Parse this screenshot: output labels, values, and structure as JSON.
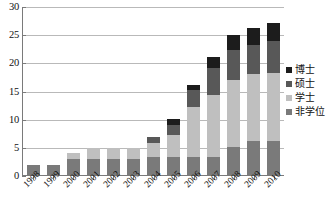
{
  "chart_data": {
    "type": "bar",
    "stacked": true,
    "title": "",
    "subtitle": "",
    "xlabel": "",
    "ylabel": "",
    "ylim": [
      0,
      30
    ],
    "yticks": [
      0,
      5,
      10,
      15,
      20,
      25,
      30
    ],
    "ytick_labels": [
      "0",
      "5",
      "10",
      "15",
      "20",
      "25",
      "30"
    ],
    "grid": true,
    "legend_position": "right",
    "categories": [
      "1998",
      "1999",
      "2000",
      "2001",
      "2002",
      "2003",
      "2004",
      "2005",
      "2006",
      "2007",
      "2008",
      "2009",
      "2010"
    ],
    "series": [
      {
        "name": "非学位",
        "color": "#7a7a7a",
        "stack_order": 1,
        "values": [
          2.0,
          2.0,
          3.0,
          3.0,
          3.0,
          3.0,
          3.3,
          3.3,
          3.3,
          3.3,
          5.2,
          6.2,
          6.3
        ]
      },
      {
        "name": "学士",
        "color": "#bfbfbf",
        "stack_order": 2,
        "values": [
          0.0,
          0.0,
          1.0,
          2.0,
          2.0,
          2.0,
          2.5,
          3.9,
          8.9,
          11.0,
          11.9,
          11.9,
          11.9
        ]
      },
      {
        "name": "硕士",
        "color": "#585858",
        "stack_order": 3,
        "values": [
          0.0,
          0.0,
          0.0,
          0.0,
          0.0,
          0.0,
          1.2,
          1.9,
          3.1,
          4.8,
          5.2,
          5.1,
          5.8
        ]
      },
      {
        "name": "博士",
        "color": "#1c1c1c",
        "stack_order": 4,
        "values": [
          0.0,
          0.0,
          0.0,
          0.0,
          0.0,
          0.0,
          0.0,
          1.0,
          0.8,
          2.1,
          2.8,
          3.0,
          3.2
        ]
      }
    ],
    "totals": [
      2.0,
      2.0,
      4.0,
      5.0,
      5.0,
      5.0,
      7.0,
      10.1,
      16.1,
      21.2,
      25.1,
      26.2,
      27.2
    ]
  },
  "legend": {
    "items": [
      {
        "label": "博士",
        "color": "#1c1c1c"
      },
      {
        "label": "硕士",
        "color": "#585858"
      },
      {
        "label": "学士",
        "color": "#bfbfbf"
      },
      {
        "label": "非学位",
        "color": "#7a7a7a"
      }
    ]
  },
  "colors": {
    "background": "#ffffff",
    "gridline": "#b9b9b9",
    "axis": "#7a7a7a",
    "text": "#111111"
  }
}
